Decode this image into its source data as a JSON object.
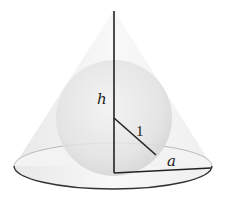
{
  "diagram": {
    "labels": {
      "height": "h",
      "sphere_radius": "1",
      "base_radius": "a"
    },
    "colors": {
      "outline": "#222222",
      "cone_fill": "#eeeeee",
      "sphere_fill": "#dcdcdc"
    }
  }
}
